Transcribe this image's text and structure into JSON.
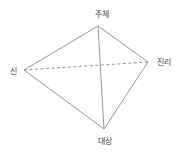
{
  "diagram": {
    "type": "tetrahedron-relation",
    "colors": {
      "line": "#8a8a8a",
      "text": "#444444",
      "background": "#ffffff"
    },
    "nodes": [
      {
        "id": "subject",
        "label": "주체",
        "x": 98,
        "y": 26,
        "label_x": 102,
        "label_y": 15
      },
      {
        "id": "god",
        "label": "신",
        "x": 24,
        "y": 70,
        "label_x": 13,
        "label_y": 72
      },
      {
        "id": "truth",
        "label": "진리",
        "x": 148,
        "y": 62,
        "label_x": 164,
        "label_y": 63
      },
      {
        "id": "object",
        "label": "대상",
        "x": 104,
        "y": 129,
        "label_x": 105,
        "label_y": 142
      }
    ],
    "edges": [
      {
        "from": "subject",
        "to": "god",
        "style": "solid"
      },
      {
        "from": "subject",
        "to": "truth",
        "style": "solid"
      },
      {
        "from": "subject",
        "to": "object",
        "style": "solid"
      },
      {
        "from": "god",
        "to": "object",
        "style": "solid"
      },
      {
        "from": "truth",
        "to": "object",
        "style": "solid"
      },
      {
        "from": "god",
        "to": "truth",
        "style": "dashed"
      }
    ]
  }
}
